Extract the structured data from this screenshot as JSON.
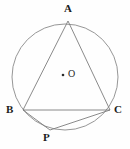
{
  "figure": {
    "background_color": "#fefefe",
    "stroke_color": "#8a8a8a",
    "label_color": "#1c1c1c",
    "labels": {
      "A": "A",
      "B": "B",
      "C": "C",
      "P": "P",
      "O": "O"
    },
    "circle": {
      "center_label": "O",
      "cx": 65,
      "cy": 77,
      "r": 53
    },
    "points": {
      "A": {
        "x": 68,
        "y": 21
      },
      "B": {
        "x": 23,
        "y": 110
      },
      "C": {
        "x": 110,
        "y": 110
      },
      "P": {
        "x": 50,
        "y": 130
      },
      "O": {
        "x": 63,
        "y": 75
      }
    },
    "segments": [
      {
        "name": "AB",
        "from": "A",
        "to": "B"
      },
      {
        "name": "AC",
        "from": "A",
        "to": "C"
      },
      {
        "name": "BC",
        "from": "B",
        "to": "C"
      },
      {
        "name": "BP",
        "from": "B",
        "to": "P"
      },
      {
        "name": "PC",
        "from": "P",
        "to": "C"
      }
    ]
  }
}
